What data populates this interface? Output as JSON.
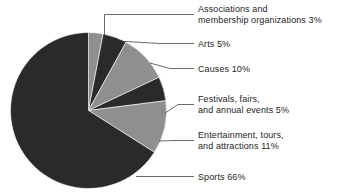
{
  "chart_data": {
    "type": "pie",
    "title": "",
    "subtitle": "",
    "xlabel": "",
    "ylabel": "",
    "legend_position": "callout-labels-right",
    "grid": false,
    "units": "percent",
    "start_angle_deg": 0,
    "direction": "clockwise",
    "categories": [
      "Associations and membership organizations",
      "Arts",
      "Causes",
      "Festivals, fairs, and annual events",
      "Entertainment, tours, and attractions",
      "Sports"
    ],
    "values": [
      3,
      5,
      10,
      5,
      11,
      66
    ],
    "labels": [
      "Associations and membership organizations 3%",
      "Arts 5%",
      "Causes 10%",
      "Festivals, fairs, and annual events 5%",
      "Entertainment, tours, and attractions 11%",
      "Sports 66%"
    ]
  },
  "colors": {
    "light_slice": "#8f8f8f",
    "dark_slice": "#2a2a2a",
    "background": "#ffffff",
    "leader_line": "#2b2b2b",
    "text": "#1d1d1d"
  },
  "slices": [
    {
      "name": "associations",
      "label": "Associations and membership organizations 3%",
      "value": 3,
      "tone": "light"
    },
    {
      "name": "arts",
      "label": "Arts 5%",
      "value": 5,
      "tone": "dark"
    },
    {
      "name": "causes",
      "label": "Causes 10%",
      "value": 10,
      "tone": "light"
    },
    {
      "name": "festivals",
      "label": "Festivals, fairs, and annual events 5%",
      "value": 5,
      "tone": "dark"
    },
    {
      "name": "entertainment",
      "label": "Entertainment, tours, and attractions 11%",
      "value": 11,
      "tone": "light"
    },
    {
      "name": "sports",
      "label": "Sports 66%",
      "value": 66,
      "tone": "dark"
    }
  ],
  "callouts": {
    "associations": {
      "line1": "Associations and",
      "line2": "membership organizations 3%"
    },
    "arts": {
      "line1": "Arts 5%",
      "line2": ""
    },
    "causes": {
      "line1": "Causes 10%",
      "line2": ""
    },
    "festivals": {
      "line1": "Festivals, fairs,",
      "line2": "and annual events 5%"
    },
    "entertainment": {
      "line1": "Entertainment, tours,",
      "line2": "and attractions 11%"
    },
    "sports": {
      "line1": "Sports 66%",
      "line2": ""
    }
  }
}
